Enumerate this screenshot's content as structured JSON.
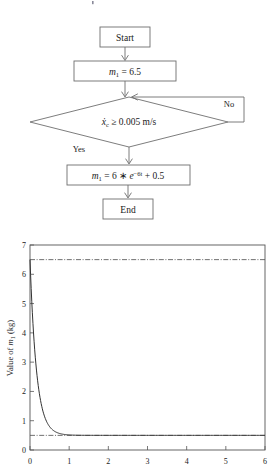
{
  "figure": {
    "flowchart": {
      "nodes": [
        {
          "id": "start",
          "type": "terminator",
          "label": "Start"
        },
        {
          "id": "init",
          "type": "process",
          "label": "m1 = 6.5",
          "parts": {
            "var": "m",
            "sub": "1",
            "rest": "= 6.5"
          }
        },
        {
          "id": "decision",
          "type": "decision",
          "label": "xc ≥ 0.005 m/s",
          "parts": {
            "var": "x",
            "sub": "c",
            "rest": "≥ 0.005 m/s"
          }
        },
        {
          "id": "update",
          "type": "process",
          "label": "m1 = 6 * e-6t + 0.5",
          "parts": {
            "var": "m",
            "sub": "1",
            "eq": "= 6 ∗",
            "base": "e",
            "exp": "−6t",
            "tail": "+ 0.5"
          }
        },
        {
          "id": "end",
          "type": "terminator",
          "label": "End"
        }
      ],
      "branches": {
        "yes_label": "Yes",
        "no_label": "No"
      }
    },
    "chart_data": {
      "type": "line",
      "title": "",
      "xlabel": "",
      "ylabel": "Value of m1 (kg)",
      "ylabel_parts": {
        "pre": "Value of ",
        "var": "m",
        "sub": "1",
        "post": " (kg)"
      },
      "xlim": [
        0,
        6
      ],
      "ylim": [
        0,
        7
      ],
      "xticks": [
        0,
        1,
        2,
        3,
        4,
        5,
        6
      ],
      "yticks": [
        0,
        1,
        2,
        3,
        4,
        5,
        6,
        7
      ],
      "xticklabels": [
        "0",
        "1",
        "2",
        "3",
        "4",
        "5",
        "6"
      ],
      "yticklabels": [
        "0",
        "1",
        "2",
        "3",
        "4",
        "5",
        "6",
        "7"
      ],
      "grid": false,
      "legend": "none",
      "series": [
        {
          "name": "m1 = 6*exp(-6t) + 0.5",
          "style": "solid",
          "x": [
            0.0,
            0.1,
            0.2,
            0.3,
            0.4,
            0.5,
            0.6,
            0.7,
            0.8,
            0.9,
            1.0,
            1.2,
            1.4,
            1.6,
            1.8,
            2.0,
            2.2,
            2.4,
            2.6,
            2.8,
            3.0,
            3.2,
            3.4,
            3.6,
            3.8,
            4.0,
            4.2,
            4.4,
            4.6,
            4.8,
            5.0,
            5.2,
            5.4,
            5.6,
            5.8,
            6.0
          ],
          "y": [
            6.5,
            5.79,
            5.17,
            4.64,
            4.17,
            3.77,
            3.41,
            3.1,
            2.83,
            2.59,
            2.39,
            2.04,
            1.76,
            1.54,
            1.36,
            1.21,
            1.09,
            0.99,
            0.91,
            0.85,
            0.79,
            0.75,
            0.71,
            0.68,
            0.66,
            0.64,
            0.63,
            0.62,
            0.61,
            0.6,
            0.59,
            0.58,
            0.58,
            0.57,
            0.57,
            0.57
          ]
        },
        {
          "name": "upper reference",
          "style": "dash-dot",
          "constant_y": 6.5
        },
        {
          "name": "lower reference",
          "style": "dash-dot",
          "constant_y": 0.5
        }
      ]
    }
  }
}
